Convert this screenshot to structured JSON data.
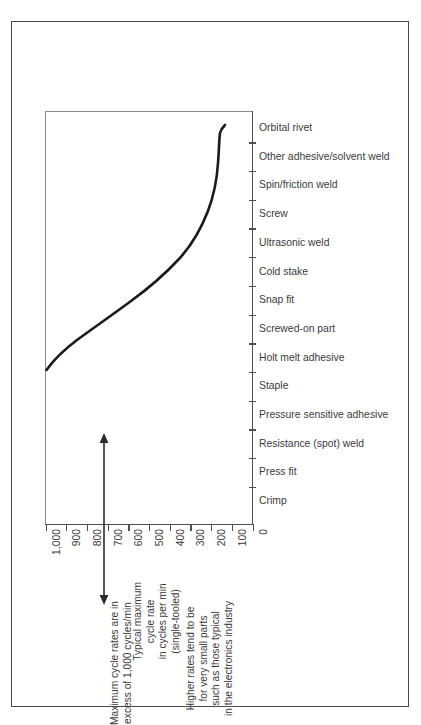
{
  "chart_data": {
    "type": "line",
    "title": "",
    "xlabel": "Typical maximum cycle rate in cycles per min (single-tooled)",
    "ylabel": "",
    "xlim": [
      1000,
      0
    ],
    "grid": false,
    "legend": "none",
    "orientation": "horizontal-categories",
    "xtick_labels": [
      "1,000",
      "900",
      "800",
      "700",
      "600",
      "500",
      "400",
      "300",
      "200",
      "100",
      "0"
    ],
    "xticks": [
      1000,
      900,
      800,
      700,
      600,
      500,
      400,
      300,
      200,
      100,
      0
    ],
    "categories": [
      "Orbital rivet",
      "Other adhesive/solvent weld",
      "Spin/friction weld",
      "Screw",
      "Ultrasonic weld",
      "Cold stake",
      "Snap fit",
      "Screwed-on part",
      "Holt melt adhesive",
      "Staple",
      "Pressure sensitive adhesive",
      "Resistance (spot) weld",
      "Press fit",
      "Crimp"
    ],
    "values": [
      5,
      12,
      18,
      22,
      26,
      34,
      60,
      120,
      230,
      330,
      430,
      560,
      720,
      1000
    ],
    "note": "Curve of maximum cycle rate versus joining method; rate decreases steeply from Crimp (left, ~1,000/min) toward Orbital rivet (right, near 0).",
    "annotations": [
      {
        "id": "max-cycle-rates",
        "lines": [
          "Maximum cycle rates are in",
          "excess of 1,000 cycles/min"
        ],
        "marker": "double-headed-vertical-arrow"
      },
      {
        "id": "higher-rates-note",
        "lines": [
          "Higher rates tend to be",
          "for very small parts",
          "such as those typical",
          "in the electronics industry"
        ],
        "marker": "none"
      }
    ]
  },
  "axis_title": {
    "line1": "Typical maximum",
    "line2": "cycle rate",
    "line3": "in cycles per min",
    "line4": "(single-tooled)"
  },
  "annot_max": {
    "line1": "Maximum cycle rates are in",
    "line2": "excess of 1,000 cycles/min"
  },
  "annot_high": {
    "line1": "Higher rates tend to be",
    "line2": "for very small parts",
    "line3": "such as those typical",
    "line4": "in the electronics industry"
  },
  "colors": {
    "curve": "#1a1a1a",
    "axis": "#4f4f4f",
    "text": "#3b3b3b",
    "frame": "#4a4a4a",
    "plot_border": "#8c8c8c"
  }
}
